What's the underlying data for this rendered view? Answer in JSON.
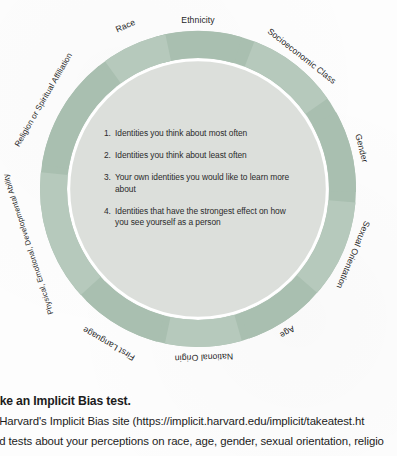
{
  "diagram": {
    "name": "social-identity-wheel",
    "title_visible": false,
    "ring_color": "#a9bfb0",
    "ring_color_alt": "#b6c9bc",
    "inner_color": "#dcdfdb",
    "divider_color": "#ffffff",
    "label_color": "#1f1f1f",
    "segments": [
      {
        "label": "Ethnicity"
      },
      {
        "label": "Socioeconomic Class"
      },
      {
        "label": "Gender"
      },
      {
        "label": "Sexual Orientation"
      },
      {
        "label": "Age"
      },
      {
        "label": "National Origin"
      },
      {
        "label": "First Language"
      },
      {
        "label": "Physical, Emotional, Developmental Ability"
      },
      {
        "label": "Religion or Spiritual Affiliation"
      },
      {
        "label": "Race"
      }
    ],
    "center_items": [
      {
        "num": "1.",
        "text": "Identities you think about most often"
      },
      {
        "num": "2.",
        "text": "Identities you think about least often"
      },
      {
        "num": "3.",
        "text": "Your own identities you would like to learn more about"
      },
      {
        "num": "4.",
        "text": "Identities that have the strongest effect on how you see yourself as a person"
      }
    ]
  },
  "bottom": {
    "heading": "ake an Implicit Bias test.",
    "line1": "t Harvard's Implicit Bias site (https://implicit.harvard.edu/implicit/takeatest.ht",
    "line2": "nd tests about your perceptions on race, age, gender, sexual orientation, religio",
    "line3": "t              one or more. Take a closer. r, an of the output: Your did you ask? Did the"
  }
}
